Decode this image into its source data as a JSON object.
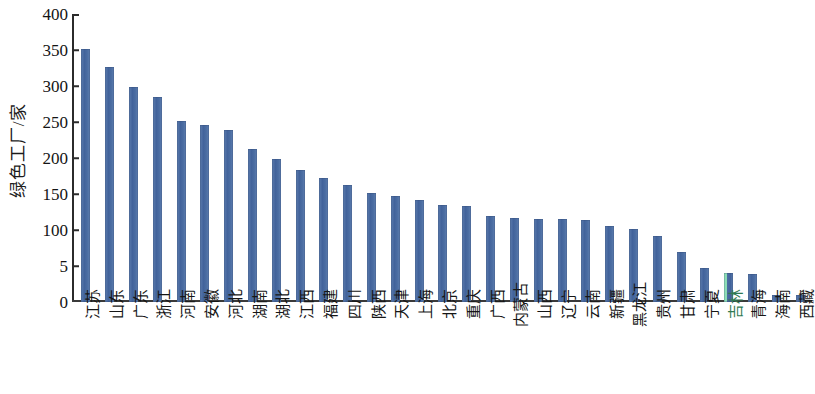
{
  "chart_data": {
    "type": "bar",
    "title": "",
    "xlabel": "",
    "ylabel": "绿色工厂/家",
    "ylim": [
      0,
      400
    ],
    "grid": false,
    "legend": "none",
    "orientation": "vertical",
    "y_tick_labels": [
      "400",
      "350",
      "300",
      "250",
      "200",
      "150",
      "100",
      "5",
      "0"
    ],
    "y_tick_values": [
      400,
      350,
      300,
      250,
      200,
      150,
      100,
      50,
      0
    ],
    "bar_color": "#4d6fa4",
    "highlight_color": "#8adcb4",
    "highlighted_category": "吉林",
    "categories": [
      "江苏",
      "山东",
      "广东",
      "浙江",
      "河南",
      "安徽",
      "河北",
      "湖南",
      "湖北",
      "江西",
      "福建",
      "四川",
      "陕西",
      "天津",
      "上海",
      "北京",
      "重庆",
      "广西",
      "内蒙古",
      "山西",
      "辽宁",
      "云南",
      "新疆",
      "黑龙江",
      "贵州",
      "甘肃",
      "宁夏",
      "吉林",
      "青海",
      "海南",
      "西藏"
    ],
    "values": [
      352,
      326,
      299,
      285,
      252,
      246,
      239,
      212,
      199,
      183,
      172,
      163,
      152,
      147,
      142,
      135,
      134,
      120,
      116,
      115,
      115,
      114,
      106,
      102,
      91,
      69,
      47,
      40,
      39,
      10,
      10
    ]
  }
}
